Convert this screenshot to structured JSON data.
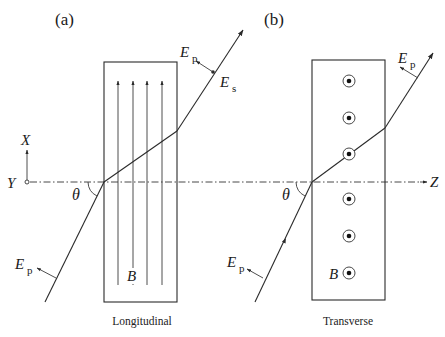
{
  "figure": {
    "panels": [
      {
        "id": "a",
        "label": "(a)",
        "caption": "Longitudinal",
        "field_label": "B",
        "field_description": "magnetic field lines parallel to X (upward arrows)",
        "incident_field_label": "E",
        "incident_field_sub": "p",
        "exit_field_p_label": "E",
        "exit_field_p_sub": "p",
        "exit_field_s_label": "E",
        "exit_field_s_sub": "s",
        "angle_label": "θ"
      },
      {
        "id": "b",
        "label": "(b)",
        "caption": "Transverse",
        "field_label": "B",
        "field_description": "magnetic field out of page (dot-in-circle symbols)",
        "incident_field_label": "E",
        "incident_field_sub": "p",
        "exit_field_p_label": "E",
        "exit_field_p_sub": "p",
        "angle_label": "θ"
      }
    ],
    "axes": {
      "x_label": "X",
      "y_label": "Y",
      "z_label": "Z"
    },
    "colors": {
      "line": "#2a2a2a",
      "background": "#ffffff"
    }
  }
}
